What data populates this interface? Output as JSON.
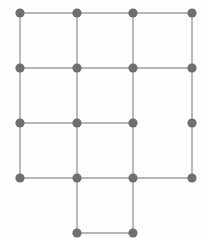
{
  "figure": {
    "width": 202,
    "height": 238,
    "background_color": "#fdfdfd",
    "node_color": "#6f6f6f",
    "node_radius": 4.6,
    "edge_color": "#9d9d9d",
    "edge_width": 1.4,
    "nodes": [
      {
        "id": "r1c1",
        "x": 20,
        "y": 13
      },
      {
        "id": "r1c2",
        "x": 77,
        "y": 13
      },
      {
        "id": "r1c3",
        "x": 133,
        "y": 13
      },
      {
        "id": "r1c4",
        "x": 192,
        "y": 13
      },
      {
        "id": "r2c1",
        "x": 20,
        "y": 68
      },
      {
        "id": "r2c2",
        "x": 77,
        "y": 68
      },
      {
        "id": "r2c3",
        "x": 133,
        "y": 68
      },
      {
        "id": "r2c4",
        "x": 192,
        "y": 68
      },
      {
        "id": "r3c1",
        "x": 20,
        "y": 123
      },
      {
        "id": "r3c2",
        "x": 77,
        "y": 123
      },
      {
        "id": "r3c3",
        "x": 133,
        "y": 123
      },
      {
        "id": "r3c4",
        "x": 192,
        "y": 123
      },
      {
        "id": "r4c1",
        "x": 20,
        "y": 178
      },
      {
        "id": "r4c2",
        "x": 77,
        "y": 178
      },
      {
        "id": "r4c3",
        "x": 133,
        "y": 178
      },
      {
        "id": "r4c4",
        "x": 192,
        "y": 178
      },
      {
        "id": "r5c2",
        "x": 77,
        "y": 233
      },
      {
        "id": "r5c3",
        "x": 133,
        "y": 233
      }
    ],
    "edges": [
      [
        "r1c1",
        "r1c2"
      ],
      [
        "r1c2",
        "r1c3"
      ],
      [
        "r1c3",
        "r1c4"
      ],
      [
        "r2c1",
        "r2c2"
      ],
      [
        "r2c2",
        "r2c3"
      ],
      [
        "r2c3",
        "r2c4"
      ],
      [
        "r3c1",
        "r3c2"
      ],
      [
        "r3c2",
        "r3c3"
      ],
      [
        "r4c1",
        "r4c2"
      ],
      [
        "r4c2",
        "r4c3"
      ],
      [
        "r4c3",
        "r4c4"
      ],
      [
        "r5c2",
        "r5c3"
      ],
      [
        "r1c1",
        "r2c1"
      ],
      [
        "r2c1",
        "r3c1"
      ],
      [
        "r3c1",
        "r4c1"
      ],
      [
        "r1c2",
        "r2c2"
      ],
      [
        "r2c2",
        "r3c2"
      ],
      [
        "r3c2",
        "r4c2"
      ],
      [
        "r4c2",
        "r5c2"
      ],
      [
        "r1c3",
        "r2c3"
      ],
      [
        "r2c3",
        "r3c3"
      ],
      [
        "r3c3",
        "r4c3"
      ],
      [
        "r4c3",
        "r5c3"
      ],
      [
        "r1c4",
        "r2c4"
      ],
      [
        "r2c4",
        "r3c4"
      ],
      [
        "r3c4",
        "r4c4"
      ]
    ]
  }
}
